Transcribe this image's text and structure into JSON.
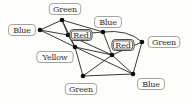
{
  "diagram": {
    "type": "graph",
    "background_color": "#fdfdfc",
    "edge_color": "#25221f",
    "node_color": "#0d0c0a",
    "node_radius": 2.3,
    "label_border_color": "#8f8c87",
    "label_border_color_emphasized": "#3e3a35",
    "label_text_color": "#33302b",
    "nodes": [
      {
        "id": "blue-left",
        "label": "Blue",
        "x": 40,
        "y": 30,
        "label_x": 22,
        "label_y": 30,
        "emphasized": false
      },
      {
        "id": "green-top",
        "label": "Green",
        "x": 62,
        "y": 20,
        "label_x": 65,
        "label_y": 9,
        "emphasized": false
      },
      {
        "id": "red-left",
        "label": "Red",
        "x": 68,
        "y": 35,
        "label_x": 81,
        "label_y": 35,
        "emphasized": true
      },
      {
        "id": "yellow",
        "label": "Yellow",
        "x": 75,
        "y": 47,
        "label_x": 55,
        "label_y": 57,
        "emphasized": false
      },
      {
        "id": "blue-top",
        "label": "Blue",
        "x": 103,
        "y": 32,
        "label_x": 108,
        "label_y": 22,
        "emphasized": false
      },
      {
        "id": "red-right",
        "label": "Red",
        "x": 112,
        "y": 55,
        "label_x": 123,
        "label_y": 45,
        "emphasized": true
      },
      {
        "id": "green-right",
        "label": "Green",
        "x": 142,
        "y": 42,
        "label_x": 164,
        "label_y": 42,
        "emphasized": false
      },
      {
        "id": "blue-bottom",
        "label": "Blue",
        "x": 133,
        "y": 74,
        "label_x": 151,
        "label_y": 84,
        "emphasized": false
      },
      {
        "id": "green-bottom",
        "label": "Green",
        "x": 83,
        "y": 76,
        "label_x": 81,
        "label_y": 89,
        "emphasized": false
      }
    ],
    "edges": [
      {
        "from": "blue-left",
        "to": "green-top"
      },
      {
        "from": "blue-left",
        "to": "red-left"
      },
      {
        "from": "blue-left",
        "to": "yellow"
      },
      {
        "from": "green-top",
        "to": "red-left"
      },
      {
        "from": "green-top",
        "to": "yellow"
      },
      {
        "from": "green-top",
        "to": "blue-top"
      },
      {
        "from": "red-left",
        "to": "yellow"
      },
      {
        "from": "red-left",
        "to": "blue-top"
      },
      {
        "from": "red-left",
        "to": "red-right"
      },
      {
        "from": "yellow",
        "to": "red-right"
      },
      {
        "from": "yellow",
        "to": "green-bottom"
      },
      {
        "from": "yellow",
        "to": "blue-bottom"
      },
      {
        "from": "blue-top",
        "to": "red-right"
      },
      {
        "from": "blue-top",
        "to": "green-right",
        "curve": [
          128,
          29
        ]
      },
      {
        "from": "red-right",
        "to": "green-right"
      },
      {
        "from": "red-right",
        "to": "green-bottom"
      },
      {
        "from": "red-right",
        "to": "blue-bottom"
      },
      {
        "from": "green-right",
        "to": "blue-bottom"
      },
      {
        "from": "green-bottom",
        "to": "blue-bottom"
      }
    ]
  }
}
